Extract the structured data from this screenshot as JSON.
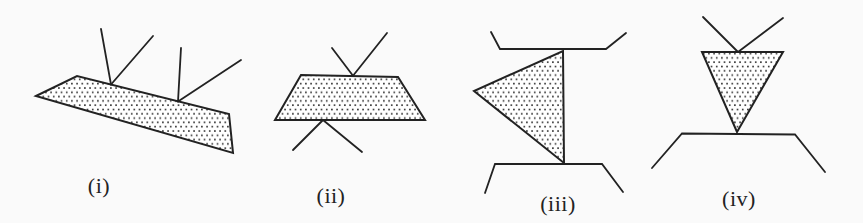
{
  "figure": {
    "colors": {
      "background": "#fafafa",
      "ink": "#222222",
      "shape_fill": "#ffffff",
      "stipple_dot": "#2b2b2b"
    },
    "canvas": {
      "width": 863,
      "height": 223
    },
    "stipple": {
      "cell_width": 5.2,
      "cell_height": 8.6,
      "dot_size": 1.6
    },
    "panels": [
      {
        "id": "i",
        "label": "(i)",
        "label_x": 99,
        "label_y": 186,
        "shape_kind": "slanted-quadrilateral-strip",
        "shape_points": "36,96 77,76 229,114 233,153",
        "segments": [
          "111,84.5 101,29",
          "111,84.5 153,36",
          "178,101.5 181,48",
          "178,101.5 241,60"
        ]
      },
      {
        "id": "ii",
        "label": "(ii)",
        "label_x": 331,
        "label_y": 196,
        "shape_kind": "trapezoid",
        "shape_points": "301,75 398,77 425,120 275,120",
        "segments": [
          "353,75.8 332,48",
          "353,75.8 387,33",
          "323,120 293,150",
          "323,120 362,152"
        ]
      },
      {
        "id": "iii",
        "label": "(iii)",
        "label_x": 558,
        "label_y": 204,
        "shape_kind": "left-pointing-triangle",
        "shape_points": "563,51 564,163 474,91",
        "segments": [
          "491,32 500,49 606,49 626,33",
          "485,193 495,164 602,164 623,192"
        ]
      },
      {
        "id": "iv",
        "label": "(iv)",
        "label_x": 739,
        "label_y": 199,
        "shape_kind": "down-pointing-triangle",
        "shape_points": "702,52 783,52 737,132",
        "segments": [
          "703,17 738,52",
          "783,18 738,52",
          "652,168 682,133.5 795,134.5 825,172"
        ]
      }
    ]
  }
}
